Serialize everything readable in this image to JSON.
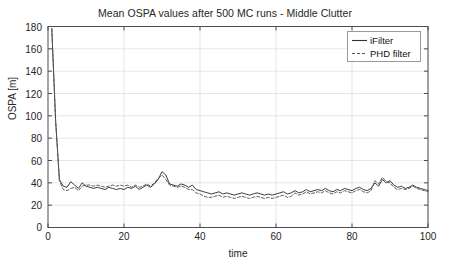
{
  "figure": {
    "title": "Mean OSPA values after 500 MC runs - Middle Clutter",
    "background": "#ffffff",
    "axis_color": "#4d4d4d",
    "grid_color": "#e6e6e6"
  },
  "axes": {
    "xlabel": "time",
    "ylabel": "OSPA [m]",
    "xticks": [
      "0",
      "20",
      "40",
      "60",
      "80",
      "100"
    ],
    "yticks": [
      "0",
      "20",
      "40",
      "60",
      "80",
      "100",
      "120",
      "140",
      "160",
      "180"
    ]
  },
  "legend": {
    "position": "top-right",
    "entries": [
      {
        "label": "iFilter",
        "style": "solid",
        "color": "#333333"
      },
      {
        "label": "PHD filter",
        "style": "dashed",
        "color": "#555555"
      }
    ]
  },
  "chart_data": {
    "type": "line",
    "title": "Mean OSPA values after 500 MC runs - Middle Clutter",
    "xlabel": "time",
    "ylabel": "OSPA [m]",
    "xlim": [
      0,
      100
    ],
    "ylim": [
      0,
      180
    ],
    "xticks": [
      0,
      20,
      40,
      60,
      80,
      100
    ],
    "yticks": [
      0,
      20,
      40,
      60,
      80,
      100,
      120,
      140,
      160,
      180
    ],
    "grid": true,
    "legend_position": "upper right",
    "x": [
      1,
      2,
      3,
      4,
      5,
      6,
      7,
      8,
      9,
      10,
      11,
      12,
      13,
      14,
      15,
      16,
      17,
      18,
      19,
      20,
      21,
      22,
      23,
      24,
      25,
      26,
      27,
      28,
      29,
      30,
      31,
      32,
      33,
      34,
      35,
      36,
      37,
      38,
      39,
      40,
      41,
      42,
      43,
      44,
      45,
      46,
      47,
      48,
      49,
      50,
      51,
      52,
      53,
      54,
      55,
      56,
      57,
      58,
      59,
      60,
      61,
      62,
      63,
      64,
      65,
      66,
      67,
      68,
      69,
      70,
      71,
      72,
      73,
      74,
      75,
      76,
      77,
      78,
      79,
      80,
      81,
      82,
      83,
      84,
      85,
      86,
      87,
      88,
      89,
      90,
      91,
      92,
      93,
      94,
      95,
      96,
      97,
      98,
      99,
      100
    ],
    "series": [
      {
        "name": "iFilter",
        "style": "solid",
        "color": "#333333",
        "values": [
          178,
          96,
          43,
          37,
          36,
          41,
          38,
          35,
          40,
          37,
          36,
          35,
          36,
          35,
          34,
          36,
          35,
          34,
          35,
          34,
          36,
          35,
          37,
          34,
          36,
          38,
          36,
          39,
          43,
          50,
          47,
          39,
          38,
          37,
          39,
          38,
          36,
          38,
          34,
          33,
          32,
          31,
          30,
          31,
          32,
          30,
          31,
          30,
          29,
          30,
          31,
          30,
          29,
          30,
          31,
          30,
          29,
          30,
          29,
          30,
          31,
          32,
          30,
          31,
          33,
          31,
          32,
          34,
          32,
          33,
          34,
          33,
          35,
          33,
          32,
          34,
          33,
          35,
          34,
          33,
          35,
          36,
          34,
          33,
          35,
          40,
          37,
          43,
          40,
          42,
          38,
          36,
          37,
          35,
          36,
          38,
          36,
          35,
          34,
          33
        ]
      },
      {
        "name": "PHD filter",
        "style": "dashed",
        "color": "#555555",
        "values": [
          178,
          96,
          42,
          34,
          33,
          35,
          36,
          33,
          37,
          38,
          38,
          37,
          38,
          37,
          36,
          37,
          38,
          37,
          38,
          37,
          38,
          36,
          38,
          36,
          37,
          39,
          37,
          40,
          44,
          47,
          43,
          38,
          37,
          36,
          37,
          36,
          34,
          34,
          31,
          30,
          28,
          27,
          27,
          28,
          29,
          27,
          28,
          27,
          26,
          27,
          28,
          27,
          26,
          27,
          28,
          27,
          26,
          27,
          26,
          27,
          28,
          29,
          27,
          28,
          31,
          29,
          30,
          32,
          30,
          31,
          32,
          31,
          33,
          31,
          30,
          32,
          31,
          33,
          32,
          31,
          33,
          34,
          32,
          31,
          33,
          42,
          39,
          45,
          41,
          40,
          36,
          34,
          35,
          34,
          35,
          37,
          35,
          34,
          33,
          32
        ]
      }
    ]
  }
}
